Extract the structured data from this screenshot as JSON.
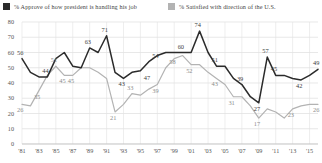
{
  "legend": {
    "series1": {
      "label": "% Approve of how president is handling his job",
      "color": "#2b2b2b",
      "swatch": "legend-swatch-approve"
    },
    "series2": {
      "label": "% Satisfied with direction of the U.S.",
      "color": "#b3b3b3",
      "swatch": "legend-swatch-satisfied"
    }
  },
  "axis": {
    "y_ticks": [
      "0",
      "10",
      "20",
      "30",
      "40",
      "50",
      "60",
      "70",
      "80"
    ],
    "x_ticks": [
      "'81",
      "'83",
      "'85",
      "'87",
      "'89",
      "'91",
      "'93",
      "'95",
      "'97",
      "'99",
      "'01",
      "'03",
      "'05",
      "'07",
      "'09",
      "'11",
      "'13",
      "'15"
    ]
  },
  "chart_data": {
    "type": "line",
    "title": "",
    "xlabel": "",
    "ylabel": "",
    "ylim": [
      0,
      80
    ],
    "grid": true,
    "legend_position": "top",
    "x": [
      1981,
      1982,
      1983,
      1984,
      1985,
      1986,
      1987,
      1988,
      1989,
      1990,
      1991,
      1992,
      1993,
      1994,
      1995,
      1996,
      1997,
      1998,
      1999,
      2000,
      2001,
      2002,
      2003,
      2004,
      2005,
      2006,
      2007,
      2008,
      2009,
      2010,
      2011,
      2012,
      2013,
      2014,
      2015,
      2016
    ],
    "series": [
      {
        "name": "% Approve of how president is handling his job",
        "color": "#2b2b2b",
        "values": [
          56,
          47,
          44,
          44,
          56,
          60,
          51,
          50,
          63,
          60,
          71,
          47,
          43,
          47,
          48,
          54,
          58,
          60,
          60,
          60,
          60,
          74,
          60,
          51,
          51,
          43,
          39,
          31,
          27,
          57,
          45,
          45,
          43,
          42,
          45,
          49
        ],
        "labels": [
          {
            "x": 1981,
            "value": 56
          },
          {
            "x": 1984,
            "value": 44
          },
          {
            "x": 1989,
            "value": 63
          },
          {
            "x": 1991,
            "value": 71
          },
          {
            "x": 1993,
            "value": 43
          },
          {
            "x": 1996,
            "value": 47
          },
          {
            "x": 1997,
            "value": 54
          },
          {
            "x": 2000,
            "value": 60
          },
          {
            "x": 2002,
            "value": 74
          },
          {
            "x": 2004,
            "value": 51
          },
          {
            "x": 2007,
            "value": 39
          },
          {
            "x": 2009,
            "value": 27
          },
          {
            "x": 2010,
            "value": 57
          },
          {
            "x": 2011,
            "value": 45
          },
          {
            "x": 2014,
            "value": 42
          },
          {
            "x": 2016,
            "value": 49
          }
        ]
      },
      {
        "name": "% Satisfied with direction of the U.S.",
        "color": "#b3b3b3",
        "values": [
          26,
          25,
          35,
          45,
          51,
          45,
          45,
          50,
          50,
          47,
          43,
          21,
          26,
          33,
          32,
          36,
          39,
          50,
          56,
          58,
          52,
          52,
          47,
          43,
          39,
          31,
          31,
          25,
          17,
          23,
          21,
          17,
          23,
          25,
          26,
          26
        ],
        "labels": [
          {
            "x": 1981,
            "value": 26
          },
          {
            "x": 1983,
            "value": 35
          },
          {
            "x": 1985,
            "value": 51
          },
          {
            "x": 1986,
            "value": 45
          },
          {
            "x": 1987,
            "value": 45
          },
          {
            "x": 1992,
            "value": 21
          },
          {
            "x": 1994,
            "value": 33
          },
          {
            "x": 1997,
            "value": 39
          },
          {
            "x": 1999,
            "value": 58
          },
          {
            "x": 2001,
            "value": 52
          },
          {
            "x": 2004,
            "value": 43
          },
          {
            "x": 2006,
            "value": 31
          },
          {
            "x": 2009,
            "value": 17
          },
          {
            "x": 2013,
            "value": 23
          },
          {
            "x": 2016,
            "value": 26
          }
        ]
      }
    ]
  }
}
